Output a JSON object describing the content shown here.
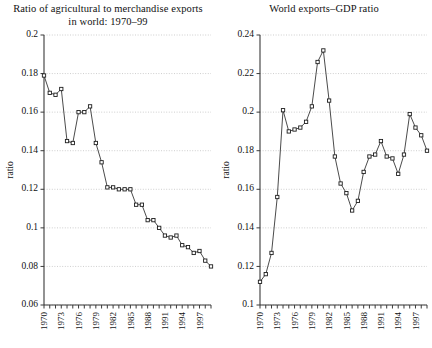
{
  "figure": {
    "background": "#ffffff",
    "axis_color": "#3a3a3a",
    "grid_color": "#b9b9b9",
    "marker_fill": "#ffffff",
    "marker_stroke": "#1d1d1d"
  },
  "panels": {
    "left": {
      "title_line1": "Ratio of agricultural to merchandise exports",
      "title_line2": "in world: 1970–99",
      "ylabel": "ratio"
    },
    "right": {
      "title_line1": "World exports–GDP ratio",
      "title_line2": "",
      "ylabel": "ratio"
    }
  },
  "chart_data": [
    {
      "type": "line",
      "title": "Ratio of agricultural to merchandise exports in world: 1970–99",
      "xlabel": "",
      "ylabel": "ratio",
      "ylim": [
        0.06,
        0.2
      ],
      "yticks": [
        0.06,
        0.08,
        0.1,
        0.12,
        0.14,
        0.16,
        0.18,
        0.2
      ],
      "ytick_labels": [
        "0.06",
        "0.08",
        "0.1",
        "0.12",
        "0.14",
        "0.16",
        "0.18",
        "0.2"
      ],
      "xlim": [
        1970,
        1999
      ],
      "xticks": [
        1970,
        1973,
        1976,
        1979,
        1982,
        1985,
        1988,
        1991,
        1994,
        1997
      ],
      "xtick_labels": [
        "1970",
        "1973",
        "1976",
        "1979",
        "1982",
        "1985",
        "1988",
        "1991",
        "1994",
        "1997"
      ],
      "grid": true,
      "legend": "none",
      "marker": "square-open",
      "x": [
        1970,
        1971,
        1972,
        1973,
        1974,
        1975,
        1976,
        1977,
        1978,
        1979,
        1980,
        1981,
        1982,
        1983,
        1984,
        1985,
        1986,
        1987,
        1988,
        1989,
        1990,
        1991,
        1992,
        1993,
        1994,
        1995,
        1996,
        1997,
        1998,
        1999
      ],
      "values": [
        0.179,
        0.17,
        0.169,
        0.172,
        0.145,
        0.144,
        0.16,
        0.16,
        0.163,
        0.144,
        0.134,
        0.121,
        0.121,
        0.12,
        0.12,
        0.12,
        0.112,
        0.112,
        0.104,
        0.104,
        0.1,
        0.096,
        0.095,
        0.096,
        0.091,
        0.09,
        0.087,
        0.088,
        0.083,
        0.08
      ]
    },
    {
      "type": "line",
      "title": "World exports–GDP ratio",
      "xlabel": "",
      "ylabel": "ratio",
      "ylim": [
        0.1,
        0.24
      ],
      "yticks": [
        0.1,
        0.12,
        0.14,
        0.16,
        0.18,
        0.2,
        0.22,
        0.24
      ],
      "ytick_labels": [
        "0.1",
        "0.12",
        "0.14",
        "0.16",
        "0.18",
        "0.2",
        "0.22",
        "0.24"
      ],
      "xlim": [
        1970,
        1999
      ],
      "xticks": [
        1970,
        1973,
        1976,
        1979,
        1982,
        1985,
        1988,
        1991,
        1994,
        1997
      ],
      "xtick_labels": [
        "1970",
        "1973",
        "1976",
        "1979",
        "1982",
        "1985",
        "1988",
        "1991",
        "1994",
        "1997"
      ],
      "grid": true,
      "legend": "none",
      "marker": "square-open",
      "x": [
        1970,
        1971,
        1972,
        1973,
        1974,
        1975,
        1976,
        1977,
        1978,
        1979,
        1980,
        1981,
        1982,
        1983,
        1984,
        1985,
        1986,
        1987,
        1988,
        1989,
        1990,
        1991,
        1992,
        1993,
        1994,
        1995,
        1996,
        1997,
        1998,
        1999
      ],
      "values": [
        0.112,
        0.116,
        0.127,
        0.156,
        0.201,
        0.19,
        0.191,
        0.192,
        0.195,
        0.203,
        0.226,
        0.232,
        0.206,
        0.177,
        0.163,
        0.158,
        0.149,
        0.154,
        0.169,
        0.177,
        0.178,
        0.185,
        0.177,
        0.176,
        0.168,
        0.178,
        0.199,
        0.192,
        0.188,
        0.18,
        0.175
      ]
    }
  ]
}
